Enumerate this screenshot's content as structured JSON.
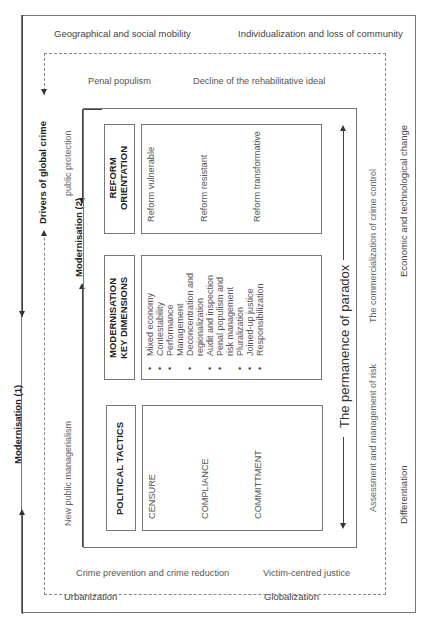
{
  "outer_frame": {
    "top_left": "Geographical and social mobility",
    "top_right": "Individualization and loss of community",
    "bottom_left": "Urbanization",
    "bottom_right": "Globalization",
    "right_top": "Economic and technological change",
    "right_bottom": "Differentiation"
  },
  "left_axis": {
    "modernisation_1": "Modernisation (1)",
    "drivers": "Drivers of global crime",
    "modernisation_2": "Modernisation (2)"
  },
  "dashed_frame": {
    "top_left": "Penal populism",
    "top_right": "Decline of the rehabilitative ideal",
    "bottom_left": "Crime prevention and crime reduction",
    "bottom_right": "Victim-centred justice",
    "left_top": "public protection",
    "left_bottom": "New public managerialism",
    "right_top": "The commercialization of crime control",
    "right_bottom": "Assessment and management of risk"
  },
  "inner_frame": {
    "paradox": "The permanence of paradox"
  },
  "columns": {
    "reform": {
      "header_line1": "REFORM",
      "header_line2": "ORIENTATION",
      "items": [
        "Reform vulnerable",
        "Reform resistant",
        "Reform transformative"
      ]
    },
    "modernisation": {
      "header_line1": "MODERNISATION",
      "header_line2": "KEY DIMENSIONS",
      "items": [
        "Mixed economy",
        "Contestability",
        "Performance",
        "Management",
        "Deconcentration and",
        "regionalization",
        "Audit and inspection",
        "Penal populism and",
        "risk management",
        "Pluralization",
        "Joined-up justice",
        "Responsibilization"
      ],
      "bullets": [
        true,
        true,
        true,
        false,
        true,
        false,
        true,
        true,
        false,
        true,
        true,
        true
      ]
    },
    "political": {
      "header": "POLITICAL TACTICS",
      "items": [
        "CENSURE",
        "COMPLIANCE",
        "COMMITTMENT"
      ]
    }
  }
}
